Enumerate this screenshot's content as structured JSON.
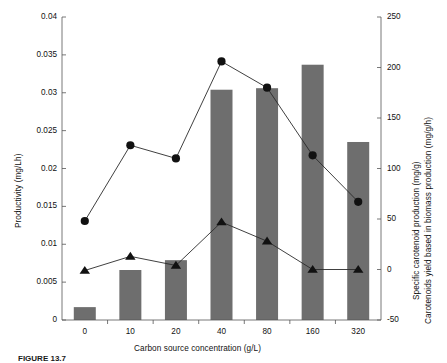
{
  "chart_data": {
    "type": "bar",
    "title": "",
    "xlabel": "Carbon source concentration (g/L)",
    "categories": [
      "0",
      "10",
      "20",
      "40",
      "80",
      "160",
      "320"
    ],
    "grid": false,
    "legend": "none",
    "axes": {
      "left": {
        "label": "Productivity (mg/Lh)",
        "ylim": [
          0,
          0.04
        ],
        "ticks": [
          "0",
          "0.005",
          "0.01",
          "0.015",
          "0.02",
          "0.025",
          "0.03",
          "0.035",
          "0.04"
        ],
        "tick_values": [
          0,
          0.005,
          0.01,
          0.015,
          0.02,
          0.025,
          0.03,
          0.035,
          0.04
        ]
      },
      "right": {
        "label_line1": "Specific carotenoid production (mg/g)",
        "label_line2": "Carotenoids yield based in biomass production (mg/g/h)",
        "ylim": [
          -50,
          250
        ],
        "ticks": [
          "-50",
          "0",
          "50",
          "100",
          "150",
          "200",
          "250"
        ],
        "tick_values": [
          -50,
          0,
          50,
          100,
          150,
          200,
          250
        ]
      }
    },
    "series": [
      {
        "name": "Productivity",
        "type": "bar",
        "axis": "left",
        "color": "#6e6e6e",
        "values": [
          0.0017,
          0.0066,
          0.0079,
          0.0304,
          0.0306,
          0.0337,
          0.0235
        ]
      },
      {
        "name": "Specific carotenoid production",
        "type": "line",
        "marker": "circle",
        "axis": "right",
        "color": "#111111",
        "values": [
          48,
          123,
          110,
          206,
          180,
          113,
          67
        ]
      },
      {
        "name": "Carotenoids yield based in biomass production",
        "type": "line",
        "marker": "triangle",
        "axis": "right",
        "color": "#111111",
        "values": [
          -1,
          13,
          4,
          47,
          28,
          0,
          0
        ]
      }
    ]
  },
  "caption": {
    "figure_label": "FIGURE 13.7",
    "text": ""
  },
  "colors": {
    "bar": "#6e6e6e",
    "line": "#2a2a2a",
    "axis": "#555555",
    "text": "#111111"
  }
}
